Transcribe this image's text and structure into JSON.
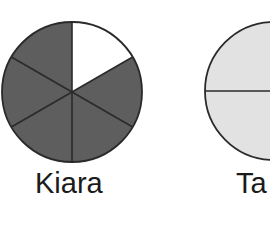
{
  "figure": {
    "type": "fraction-circles",
    "colors": {
      "shaded": "#5e5e5e",
      "unshaded_white": "#ffffff",
      "light_fill": "#e2e2e2",
      "outline": "#2a2a2a",
      "label_text": "#1a1a1a"
    },
    "circles": [
      {
        "name": "Kiara",
        "label": "Kiara",
        "cx": 72,
        "cy": 92,
        "r": 70,
        "slices": 6,
        "start_angle_deg": 90,
        "slice_fills": [
          "white",
          "shaded",
          "shaded",
          "shaded",
          "shaded",
          "shaded"
        ],
        "shaded_count": 5
      },
      {
        "name": "Ta",
        "label": "Ta",
        "cx": 274,
        "cy": 91,
        "r": 69,
        "slices": 2,
        "start_angle_deg": 180,
        "slice_fills": [
          "light",
          "light"
        ],
        "shaded_count": 0
      }
    ]
  }
}
